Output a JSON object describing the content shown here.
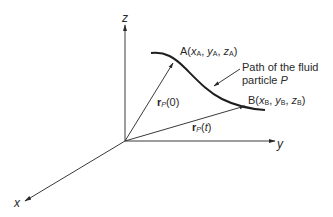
{
  "figure": {
    "type": "3d-coordinate-diagram",
    "colors": {
      "ink": "#2a2a2a",
      "axis": "#3a3a3a",
      "background": "#ffffff"
    }
  },
  "axes": {
    "z": {
      "label": "z"
    },
    "y": {
      "label": "y"
    },
    "x": {
      "label": "x"
    }
  },
  "points": {
    "A": {
      "name": "A",
      "open": "(",
      "x": "x",
      "x_sub": "A",
      "y": "y",
      "y_sub": "A",
      "z": "z",
      "z_sub": "A",
      "close": ")",
      "sep": ", "
    },
    "B": {
      "name": "B",
      "open": "(",
      "x": "x",
      "x_sub": "B",
      "y": "y",
      "y_sub": "B",
      "z": "z",
      "z_sub": "B",
      "close": ")",
      "sep": ", "
    }
  },
  "vectors": {
    "r0": {
      "r": "r",
      "sub": "P",
      "arg": "(0)"
    },
    "rt": {
      "r": "r",
      "sub": "P",
      "arg_open": "(",
      "arg": "t",
      "arg_close": ")"
    }
  },
  "annotation": {
    "line1": "Path of the fluid",
    "line2_prefix": "particle ",
    "line2_italic": "P"
  }
}
